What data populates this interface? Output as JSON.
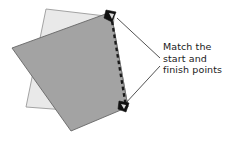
{
  "diagram": {
    "title": "Match the start and finish points",
    "type": "overlapping-quadrilaterals-tracing-instruction",
    "canvas": {
      "width": 229,
      "height": 142,
      "background": "#ffffff"
    },
    "colors": {
      "background_shape_fill": "#e9e9e9",
      "background_shape_stroke": "#9a9a9a",
      "foreground_shape_fill": "#a3a3a3",
      "foreground_shape_stroke": "#666666",
      "dashed_path_stroke": "#1a1a1a",
      "marker_fill": "#111111",
      "leader_line_stroke": "#333333",
      "text_color": "#1a1a1a"
    },
    "shapes": [
      {
        "name": "background-quadrilateral",
        "fill": "#e9e9e9",
        "stroke": "#9a9a9a",
        "points": "46,9 114,17 106,113 26,107"
      },
      {
        "name": "foreground-quadrilateral",
        "fill": "#a3a3a3",
        "stroke": "#666666",
        "points": "12,48 111,12 128,107 71,131"
      }
    ],
    "dashed_path": {
      "name": "tracing-path",
      "start_point": {
        "x": 111,
        "y": 14
      },
      "end_point": {
        "x": 126,
        "y": 108
      },
      "stroke": "#1a1a1a",
      "stroke_width": 2.2,
      "dash_pattern": "3.5 3"
    },
    "markers": [
      {
        "name": "start-point-marker",
        "x": 111,
        "y": 14,
        "label": "start"
      },
      {
        "name": "finish-point-marker",
        "x": 126,
        "y": 108,
        "label": "finish"
      }
    ],
    "leader_lines": [
      {
        "name": "leader-line-to-start",
        "x1": 160,
        "y1": 58,
        "x2": 116,
        "y2": 17
      },
      {
        "name": "leader-line-to-finish",
        "x1": 160,
        "y1": 66,
        "x2": 124,
        "y2": 106
      }
    ]
  },
  "annotation": {
    "name": "instruction-callout",
    "lines": [
      "Match the",
      "start and",
      "finish points"
    ],
    "line1": "Match the",
    "line2": "start and",
    "line3": "finish points"
  }
}
